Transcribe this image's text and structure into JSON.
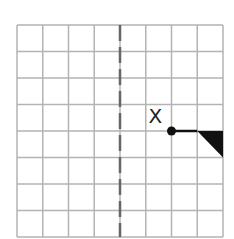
{
  "diagram": {
    "type": "grid-reflection",
    "grid": {
      "columns": 8,
      "rows": 8,
      "origin": [
        17,
        25
      ],
      "cell_width": 25.75,
      "cell_height": 26.5,
      "line_color": "#b3b3b3"
    },
    "mirror_line": {
      "orientation": "vertical",
      "column_index": 4,
      "style": "dashed",
      "color": "#666666"
    },
    "point": {
      "label": "X",
      "grid_x": 6,
      "grid_y": 4,
      "color": "#111111"
    },
    "shape": {
      "segment_from": [
        6,
        4
      ],
      "segment_to": [
        7,
        4
      ],
      "triangle": [
        [
          7,
          4
        ],
        [
          8,
          4
        ],
        [
          8,
          5
        ]
      ],
      "fill": "#111111"
    }
  }
}
